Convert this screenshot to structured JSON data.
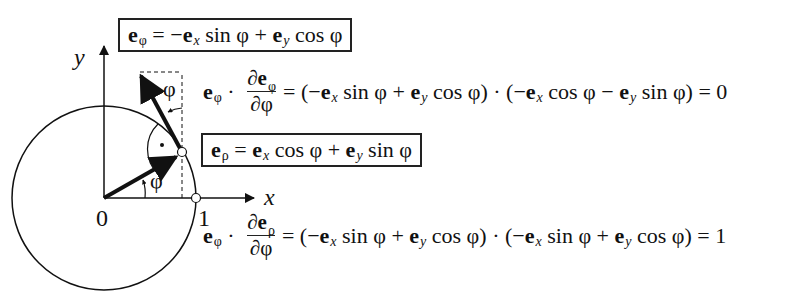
{
  "figure": {
    "axes": {
      "x_label": "x",
      "y_label": "y",
      "origin_label": "0",
      "unit_label": "1"
    },
    "angle_labels": [
      "φ",
      "φ"
    ],
    "right_angle_marker": "·",
    "colors": {
      "ink": "#111111",
      "background": "#ffffff"
    }
  },
  "equations": {
    "e_phi_def": {
      "lhs": "e",
      "lhs_sub": "φ",
      "eq": " = −",
      "t1": "e",
      "t1_sub": "x",
      "t1_fn": " sin φ + ",
      "t2": "e",
      "t2_sub": "y",
      "t2_fn": " cos φ"
    },
    "e_rho_def": {
      "lhs": "e",
      "lhs_sub": "ρ",
      "eq": " = ",
      "t1": "e",
      "t1_sub": "x",
      "t1_fn": " cos φ + ",
      "t2": "e",
      "t2_sub": "y",
      "t2_fn": " sin φ"
    },
    "dot1": {
      "lhs": "e",
      "lhs_sub": "φ",
      "dot": " · ",
      "num_d": "∂",
      "num_e": "e",
      "num_sub": "φ",
      "den": "∂φ",
      "rhs_a": "= (−",
      "a1": "e",
      "a1_sub": "x",
      "a1_fn": " sin φ + ",
      "a2": "e",
      "a2_sub": "y",
      "a2_fn": " cos φ) · (−",
      "b1": "e",
      "b1_sub": "x",
      "b1_fn": " cos φ − ",
      "b2": "e",
      "b2_sub": "y",
      "b2_fn": " sin φ) = 0"
    },
    "dot2": {
      "lhs": "e",
      "lhs_sub": "φ",
      "dot": " · ",
      "num_d": "∂",
      "num_e": "e",
      "num_sub": "ρ",
      "den": "∂φ",
      "rhs_a": "= (−",
      "a1": "e",
      "a1_sub": "x",
      "a1_fn": " sin φ + ",
      "a2": "e",
      "a2_sub": "y",
      "a2_fn": " cos φ) · (−",
      "b1": "e",
      "b1_sub": "x",
      "b1_fn": " sin φ + ",
      "b2": "e",
      "b2_sub": "y",
      "b2_fn": " cos φ) = 1"
    }
  }
}
